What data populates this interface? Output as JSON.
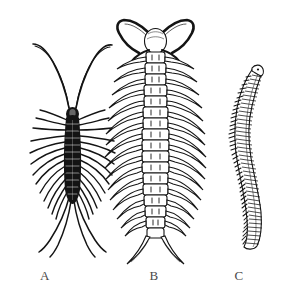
{
  "plate": {
    "background_color": "#ffffff",
    "ink_color": "#1a1a1a",
    "width": 291,
    "height": 300,
    "style": "scientific line engraving",
    "subject": "myriapods"
  },
  "labels": {
    "a": "A",
    "b": "B",
    "c": "C"
  },
  "specimens": [
    {
      "key": "a",
      "label": "A",
      "common_name": "house centipede",
      "orientation": "dorsal view, head up",
      "body_segments": 15,
      "leg_pairs": 15,
      "antennae": 2,
      "antenna_style": "very long, whip-like, curving outward",
      "leg_style": "long, thin, radiating, rear pair longest",
      "body_outline_color": "#111111",
      "center_x": 72,
      "top_y": 45,
      "bottom_y": 255
    },
    {
      "key": "b",
      "label": "B",
      "common_name": "centipede",
      "orientation": "dorsal view, head up",
      "body_segments": 20,
      "leg_pairs": 20,
      "antennae": 2,
      "antenna_style": "short, thick, curving outward and down",
      "leg_style": "segmented, tapering, curving downward",
      "terminal_legs": 2,
      "body_outline_color": "#111111",
      "center_x": 155,
      "top_y": 18,
      "bottom_y": 262
    },
    {
      "key": "c",
      "label": "C",
      "common_name": "millipede",
      "orientation": "lateral view, head up",
      "body_segments": 48,
      "leg_pairs": 48,
      "antennae": 0,
      "body_shape": "sinuous S-curve, cylindrical",
      "leg_style": "very short, dense, along ventral margin",
      "body_outline_color": "#111111",
      "center_x": 245,
      "top_y": 65,
      "bottom_y": 250
    }
  ]
}
